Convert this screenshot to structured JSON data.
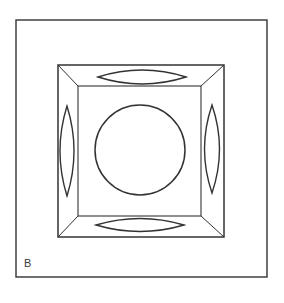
{
  "figure": {
    "panel_label": "B",
    "colors": {
      "stroke": "#333333",
      "background": "#ffffff"
    },
    "outer_frame": {
      "x": 16,
      "y": 20,
      "width": 251,
      "height": 257
    },
    "bevel_outer": {
      "x": 58,
      "y": 65,
      "width": 166,
      "height": 172
    },
    "bevel_inner": {
      "x": 78,
      "y": 86,
      "width": 123,
      "height": 130
    },
    "center_circle": {
      "cx": 140,
      "cy": 150,
      "r": 45
    },
    "lenses": [
      {
        "position": "top",
        "cx": 142,
        "cy": 77,
        "rx": 44,
        "ry": 7
      },
      {
        "position": "bottom",
        "cx": 140,
        "cy": 225,
        "rx": 44,
        "ry": 6.5
      },
      {
        "position": "left",
        "cx": 67,
        "cy": 151,
        "rx": 7,
        "ry": 45
      },
      {
        "position": "right",
        "cx": 212,
        "cy": 149,
        "rx": 7.5,
        "ry": 44
      }
    ]
  }
}
